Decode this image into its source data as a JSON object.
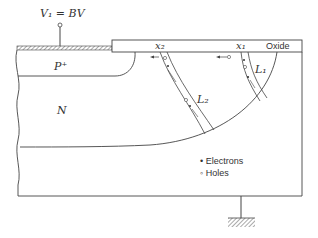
{
  "diagram": {
    "voltage_label": "V₁ = BV",
    "p_region_label": "P⁺",
    "n_region_label": "N",
    "oxide_label": "Oxide",
    "x1_label": "x₁",
    "x2_label": "x₂",
    "l1_label": "L₁",
    "l2_label": "L₂",
    "legend": {
      "electrons": "• Electrons",
      "holes": "◦ Holes"
    }
  },
  "colors": {
    "line": "#444444",
    "text": "#333333",
    "background": "#ffffff"
  }
}
